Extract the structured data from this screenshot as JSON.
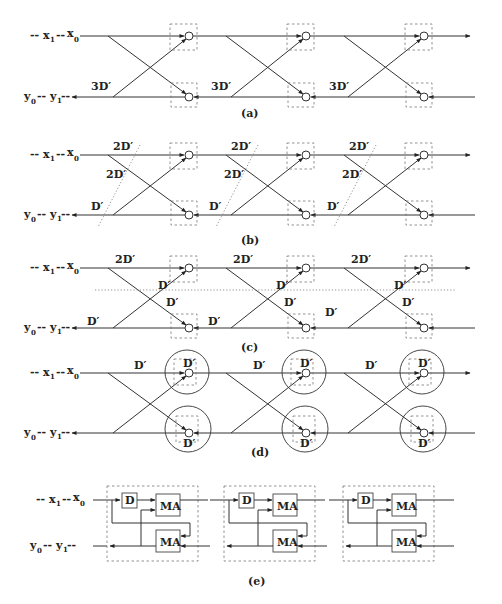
{
  "figure": {
    "panels": [
      {
        "id": "a",
        "caption": "(a)",
        "input_label": {
          "dash1": "--",
          "x1": "x",
          "x1_sub": "1",
          "dash2": "--",
          "x0": "x",
          "x0_sub": "0"
        },
        "output_label": {
          "y0": "y",
          "y0_sub": "0",
          "dash": "--",
          "y1": "y",
          "y1_sub": "1",
          "dash2": "--"
        },
        "delay_labels": [
          "3D′",
          "3D′",
          "3D′"
        ],
        "stages": 3
      },
      {
        "id": "b",
        "caption": "(b)",
        "input_label": {
          "dash1": "--",
          "x1": "x",
          "x1_sub": "1",
          "dash2": "--",
          "x0": "x",
          "x0_sub": "0"
        },
        "output_label": {
          "y0": "y",
          "y0_sub": "0",
          "dash": "--",
          "y1": "y",
          "y1_sub": "1",
          "dash2": "--"
        },
        "delay_labels": {
          "top": [
            "2D′",
            "2D′",
            "2D′"
          ],
          "mid": [
            "2D′",
            "2D′",
            "2D′"
          ],
          "bottom": [
            "D′",
            "D′",
            "D′"
          ]
        },
        "stages": 3
      },
      {
        "id": "c",
        "caption": "(c)",
        "input_label": {
          "dash1": "--",
          "x1": "x",
          "x1_sub": "1",
          "dash2": "--",
          "x0": "x",
          "x0_sub": "0"
        },
        "output_label": {
          "y0": "y",
          "y0_sub": "0",
          "dash": "--",
          "y1": "y",
          "y1_sub": "1",
          "dash2": "--"
        },
        "delay_labels": {
          "top": [
            "2D′",
            "2D′",
            "2D′"
          ],
          "cross_up": [
            "D′",
            "D′",
            "D′"
          ],
          "cross_down": [
            "D′",
            "D′",
            "D′"
          ],
          "bottom": [
            "D′",
            "D′",
            "D′"
          ]
        },
        "stages": 3
      },
      {
        "id": "d",
        "caption": "(d)",
        "input_label": {
          "dash1": "--",
          "x1": "x",
          "x1_sub": "1",
          "dash2": "--",
          "x0": "x",
          "x0_sub": "0"
        },
        "output_label": {
          "y0": "y",
          "y0_sub": "0",
          "dash": "--",
          "y1": "y",
          "y1_sub": "1",
          "dash2": "--"
        },
        "delay_labels": {
          "top": [
            "D′",
            "D′",
            "D′"
          ],
          "node_top": [
            "D′",
            "D′",
            "D′"
          ],
          "node_bottom": [
            "D′",
            "D′",
            "D′"
          ]
        },
        "stages": 3
      },
      {
        "id": "e",
        "caption": "(e)",
        "input_label": {
          "dash1": "--",
          "x1": "x",
          "x1_sub": "1",
          "dash2": "--",
          "x0": "x",
          "x0_sub": "0"
        },
        "output_label": {
          "y0": "y",
          "y0_sub": "0",
          "dash": "--",
          "y1": "y",
          "y1_sub": "1",
          "dash2": "--"
        },
        "blocks": {
          "delay": "D",
          "multiply_add": "MA"
        },
        "stages": 3
      }
    ]
  }
}
